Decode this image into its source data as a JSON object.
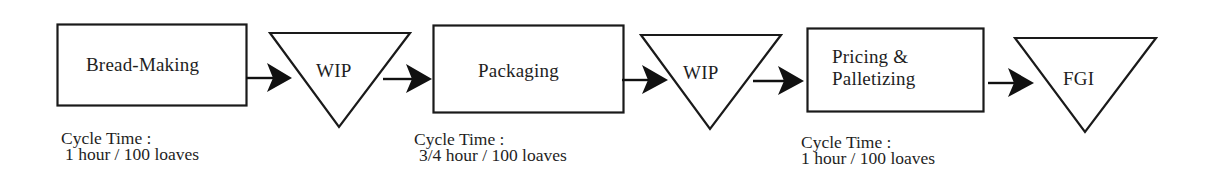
{
  "diagram": {
    "type": "process-flow",
    "stroke_color": "#1a1a1a",
    "background_color": "#ffffff",
    "nodes": [
      {
        "id": "bread-making",
        "shape": "rectangle",
        "kind": "process",
        "label": "Bread-Making",
        "cycle_time_label": "Cycle Time :",
        "cycle_time_value": "1 hour / 100 loaves"
      },
      {
        "id": "wip-1",
        "shape": "inverted-triangle",
        "kind": "inventory",
        "label": "WIP"
      },
      {
        "id": "packaging",
        "shape": "rectangle",
        "kind": "process",
        "label": "Packaging",
        "cycle_time_label": "Cycle Time :",
        "cycle_time_value": "3/4 hour / 100 loaves"
      },
      {
        "id": "wip-2",
        "shape": "inverted-triangle",
        "kind": "inventory",
        "label": "WIP"
      },
      {
        "id": "pricing-palletizing",
        "shape": "rectangle",
        "kind": "process",
        "label_line1": "Pricing &",
        "label_line2": "Palletizing",
        "cycle_time_label": "Cycle Time :",
        "cycle_time_value": "1 hour / 100 loaves"
      },
      {
        "id": "fgi",
        "shape": "inverted-triangle",
        "kind": "inventory",
        "label": "FGI"
      }
    ],
    "edges": [
      {
        "from": "bread-making",
        "to": "wip-1"
      },
      {
        "from": "wip-1",
        "to": "packaging"
      },
      {
        "from": "packaging",
        "to": "wip-2"
      },
      {
        "from": "wip-2",
        "to": "pricing-palletizing"
      },
      {
        "from": "pricing-palletizing",
        "to": "fgi"
      }
    ]
  }
}
